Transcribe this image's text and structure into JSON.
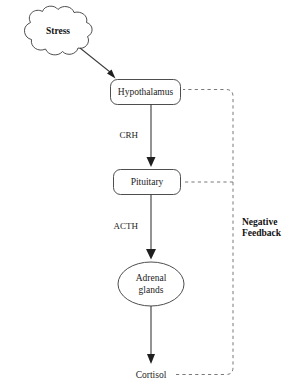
{
  "diagram": {
    "nodes": {
      "stress": {
        "label": "Stress",
        "shape": "cloud"
      },
      "hypothalamus": {
        "label": "Hypothalamus",
        "shape": "rounded-rect"
      },
      "pituitary": {
        "label": "Pituitary",
        "shape": "rounded-rect"
      },
      "adrenal_line1": {
        "label": "Adrenal",
        "shape": "ellipse"
      },
      "adrenal_line2": {
        "label": "glands",
        "shape": "ellipse"
      },
      "cortisol": {
        "label": "Cortisol",
        "shape": "text"
      }
    },
    "edge_labels": {
      "crh": "CRH",
      "acth": "ACTH"
    },
    "feedback": {
      "line1": "Negative",
      "line2": "Feedback"
    },
    "colors": {
      "background": "#ffffff",
      "stroke": "#3a3a3a",
      "dashed_stroke": "#6a6a6a",
      "text": "#1b1b1b",
      "arrow": "#1f1f1f"
    }
  }
}
